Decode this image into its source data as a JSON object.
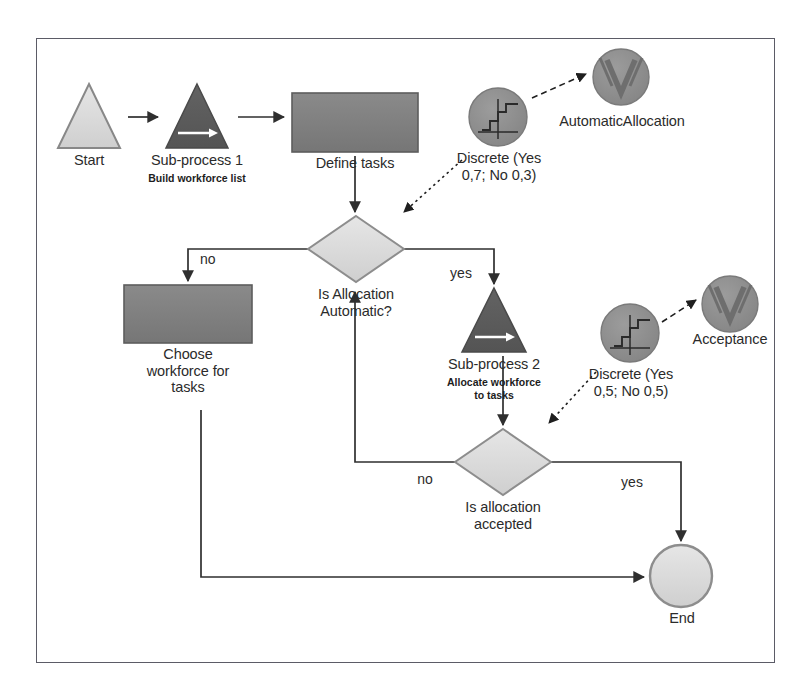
{
  "diagram": {
    "type": "process-flowchart",
    "background_color": "#ffffff",
    "frame_border_color": "#5b5b66",
    "palette": {
      "light_fill": "#d9d9d9",
      "dark_fill": "#5c5c5c",
      "mid_fill": "#7d7d7d",
      "circle_fill": "#8d8d8d",
      "outline": "#6b6b6b",
      "line": "#2f2f2f",
      "text": "#2b2b2b",
      "arrow_white": "#ffffff"
    },
    "nodes": [
      {
        "id": "start",
        "shape": "triangle",
        "style": "light",
        "label": "Start",
        "sublabel": "",
        "x": 58,
        "y": 84,
        "w": 62,
        "h": 64
      },
      {
        "id": "subprocess1",
        "shape": "triangle",
        "style": "dark-arrow",
        "label": "Sub-process 1",
        "sublabel": "Build workforce list",
        "x": 166,
        "y": 84,
        "w": 62,
        "h": 64
      },
      {
        "id": "define-tasks",
        "shape": "rectangle",
        "style": "mid",
        "label": "Define tasks",
        "sublabel": "",
        "x": 292,
        "y": 93,
        "w": 126,
        "h": 59
      },
      {
        "id": "discrete-1",
        "shape": "circle-steps",
        "style": "circle",
        "label": "Discrete (Yes\n0,7; No 0,3)",
        "sublabel": "",
        "x": 469,
        "y": 88,
        "w": 58,
        "h": 58
      },
      {
        "id": "automatic-allocation",
        "shape": "circle-v",
        "style": "circle",
        "label": "AutomaticAllocation",
        "sublabel": "",
        "x": 593,
        "y": 49,
        "w": 56,
        "h": 56
      },
      {
        "id": "is-allocation-automatic",
        "shape": "diamond",
        "style": "light",
        "label": "Is Allocation\nAutomatic?",
        "sublabel": "",
        "x": 308,
        "y": 216,
        "w": 96,
        "h": 66
      },
      {
        "id": "choose-workforce",
        "shape": "rectangle",
        "style": "mid",
        "label": "Choose\nworkforce for\ntasks",
        "sublabel": "",
        "x": 124,
        "y": 285,
        "w": 128,
        "h": 58
      },
      {
        "id": "subprocess2",
        "shape": "triangle",
        "style": "dark-arrow",
        "label": "Sub-process 2",
        "sublabel": "Allocate workforce\nto tasks",
        "x": 462,
        "y": 288,
        "w": 64,
        "h": 64
      },
      {
        "id": "discrete-2",
        "shape": "circle-steps",
        "style": "circle",
        "label": "Discrete (Yes\n0,5; No 0,5)",
        "sublabel": "",
        "x": 601,
        "y": 304,
        "w": 58,
        "h": 58
      },
      {
        "id": "acceptance",
        "shape": "circle-v",
        "style": "circle",
        "label": "Acceptance",
        "sublabel": "",
        "x": 702,
        "y": 276,
        "w": 56,
        "h": 56
      },
      {
        "id": "is-allocation-accepted",
        "shape": "diamond",
        "style": "light",
        "label": "Is allocation\naccepted",
        "sublabel": "",
        "x": 455,
        "y": 429,
        "w": 96,
        "h": 66
      },
      {
        "id": "end",
        "shape": "circle",
        "style": "light",
        "label": "End",
        "sublabel": "",
        "x": 650,
        "y": 545,
        "w": 62,
        "h": 62
      }
    ],
    "edges": [
      {
        "id": "start-to-sub1",
        "from": "start",
        "to": "subprocess1",
        "label": "",
        "style": "solid-arrow"
      },
      {
        "id": "sub1-to-define",
        "from": "subprocess1",
        "to": "define-tasks",
        "label": "",
        "style": "solid-arrow"
      },
      {
        "id": "define-to-decision",
        "from": "define-tasks",
        "to": "is-allocation-automatic",
        "label": "",
        "style": "solid-arrow"
      },
      {
        "id": "discrete1-to-decision",
        "from": "discrete-1",
        "to": "is-allocation-automatic",
        "label": "",
        "style": "dotted-arrow"
      },
      {
        "id": "discrete1-to-automatic",
        "from": "discrete-1",
        "to": "automatic-allocation",
        "label": "",
        "style": "dashed-arrow"
      },
      {
        "id": "decision-no",
        "from": "is-allocation-automatic",
        "to": "choose-workforce",
        "label": "no",
        "style": "solid-arrow"
      },
      {
        "id": "decision-yes",
        "from": "is-allocation-automatic",
        "to": "subprocess2",
        "label": "yes",
        "style": "solid-arrow"
      },
      {
        "id": "sub2-to-accepted",
        "from": "subprocess2",
        "to": "is-allocation-accepted",
        "label": "",
        "style": "solid-arrow"
      },
      {
        "id": "discrete2-to-accepted",
        "from": "discrete-2",
        "to": "is-allocation-accepted",
        "label": "",
        "style": "dotted-arrow"
      },
      {
        "id": "discrete2-to-acceptance",
        "from": "discrete-2",
        "to": "acceptance",
        "label": "",
        "style": "dashed-arrow"
      },
      {
        "id": "accepted-no",
        "from": "is-allocation-accepted",
        "to": "is-allocation-automatic",
        "label": "no",
        "style": "solid-arrow"
      },
      {
        "id": "accepted-yes",
        "from": "is-allocation-accepted",
        "to": "end",
        "label": "yes",
        "style": "solid-arrow"
      },
      {
        "id": "choose-to-end",
        "from": "choose-workforce",
        "to": "end",
        "label": "",
        "style": "solid-arrow"
      }
    ]
  },
  "labels": {
    "start": "Start",
    "subprocess1": "Sub-process 1",
    "subprocess1_sub": "Build workforce list",
    "define_tasks": "Define tasks",
    "discrete1": "Discrete (Yes\n0,7; No 0,3)",
    "automatic_allocation": "AutomaticAllocation",
    "is_allocation_automatic": "Is Allocation\nAutomatic?",
    "choose_workforce": "Choose\nworkforce for\ntasks",
    "subprocess2": "Sub-process 2",
    "subprocess2_sub": "Allocate workforce\nto tasks",
    "discrete2": "Discrete (Yes\n0,5; No 0,5)",
    "acceptance": "Acceptance",
    "is_allocation_accepted": "Is allocation\naccepted",
    "end": "End",
    "edge_no_1": "no",
    "edge_yes_1": "yes",
    "edge_no_2": "no",
    "edge_yes_2": "yes"
  }
}
